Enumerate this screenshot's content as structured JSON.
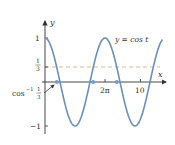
{
  "chart_data": {
    "type": "line",
    "title": "",
    "xlabel": "x",
    "ylabel": "y",
    "series": [
      {
        "name": "y = cos t",
        "function": "cos(t)",
        "t_range": [
          0,
          12.3
        ],
        "color": "#6b8fb8"
      },
      {
        "name": "y = 1/3",
        "function": "1/3",
        "style": "dashed",
        "color": "#e8b090"
      }
    ],
    "x_ticks": [
      {
        "value": 6.2832,
        "label": "2π"
      },
      {
        "value": 10,
        "label": "10"
      }
    ],
    "y_ticks": [
      {
        "value": 1,
        "label": "1"
      },
      {
        "value": 0.3333,
        "label": "1/3"
      },
      {
        "value": -1,
        "label": "−1"
      }
    ],
    "marked_points": [
      {
        "x": 1.23,
        "y": 0
      },
      {
        "x": 5.05,
        "y": 0
      },
      {
        "x": 7.51,
        "y": 0
      }
    ],
    "annotations": [
      {
        "text": "y = cos t",
        "position": "upper right"
      },
      {
        "text": "cos⁻¹ 1/3",
        "points_to": 1.23
      }
    ],
    "xlim": [
      0,
      12.5
    ],
    "ylim": [
      -1.2,
      1.3
    ],
    "grid": false
  },
  "labels": {
    "y_axis": "y",
    "x_axis": "x",
    "curve": "y = cos t",
    "tick_one": "1",
    "tick_third_num": "1",
    "tick_third_den": "3",
    "tick_neg_one": "−1",
    "tick_two_pi": "2π",
    "tick_ten": "10",
    "arccos_prefix": "cos",
    "arccos_sup": "−1",
    "arccos_num": "1",
    "arccos_den": "3"
  }
}
